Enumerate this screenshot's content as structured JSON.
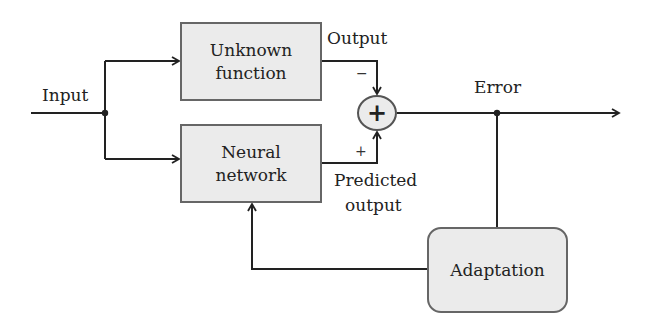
{
  "diagram": {
    "title": "",
    "nodes": {
      "unknown_function": {
        "line1": "Unknown",
        "line2": "function"
      },
      "neural_network": {
        "line1": "Neural",
        "line2": "network"
      },
      "adaptation": {
        "label": "Adaptation"
      },
      "summing_junction": {
        "symbol": "+"
      }
    },
    "labels": {
      "input": "Input",
      "output": "Output",
      "predicted_output_line1": "Predicted",
      "predicted_output_line2": "output",
      "error": "Error",
      "minus_sign": "−",
      "plus_sign": "+"
    },
    "edges": [
      {
        "from": "Input",
        "to": "Unknown function"
      },
      {
        "from": "Input",
        "to": "Neural network"
      },
      {
        "from": "Unknown function",
        "to": "summing junction",
        "sign": "-"
      },
      {
        "from": "Neural network",
        "to": "summing junction",
        "sign": "+"
      },
      {
        "from": "summing junction",
        "to": "Error output"
      },
      {
        "from": "Error",
        "to": "Adaptation"
      },
      {
        "from": "Adaptation",
        "to": "Neural network"
      }
    ],
    "colors": {
      "box_fill": "#ebebeb",
      "box_border": "#666666",
      "line": "#222222"
    }
  }
}
